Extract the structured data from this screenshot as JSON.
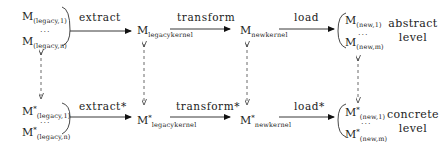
{
  "diagram": {
    "abstract_row": {
      "legacy_models": {
        "base": "M",
        "first_sub": "(legacy,1)",
        "dots": "...",
        "last_sub": "(legacy,n)"
      },
      "edges": [
        {
          "label": "extract"
        },
        {
          "label": "transform"
        },
        {
          "label": "load"
        }
      ],
      "legacy_kernel": {
        "base": "M",
        "sub": "legacykernel"
      },
      "new_kernel": {
        "base": "M",
        "sub": "newkernel"
      },
      "new_models": {
        "base": "M",
        "first_sub": "(new,1)",
        "dots": "...",
        "last_sub": "(new,m)"
      },
      "level_label": [
        "abstract",
        "level"
      ]
    },
    "concrete_row": {
      "legacy_models": {
        "base": "M",
        "star": "*",
        "first_sub": "(legacy,1)",
        "dots": "...",
        "last_sub": "(legacy,n)"
      },
      "edges": [
        {
          "label": "extract*"
        },
        {
          "label": "transform*"
        },
        {
          "label": "load*"
        }
      ],
      "legacy_kernel": {
        "base": "M",
        "star": "*",
        "sub": "legacykernel"
      },
      "new_kernel": {
        "base": "M",
        "star": "*",
        "sub": "newkernel"
      },
      "new_models": {
        "base": "M",
        "star": "*",
        "first_sub": "(new,1)",
        "dots": "...",
        "last_sub": "(new,m)"
      },
      "level_label": [
        "concrete",
        "level"
      ]
    },
    "vertical_links": [
      {
        "between": "legacy_models",
        "style": "dashed",
        "direction": "bidirectional"
      },
      {
        "between": "legacy_kernel",
        "style": "dashed",
        "direction": "bidirectional"
      },
      {
        "between": "new_kernel",
        "style": "dashed",
        "direction": "bidirectional"
      },
      {
        "between": "new_models",
        "style": "dashed",
        "direction": "bidirectional"
      }
    ]
  }
}
